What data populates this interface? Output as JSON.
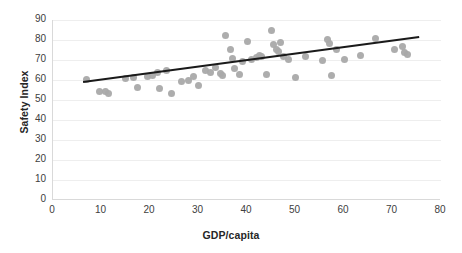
{
  "chart_data": {
    "type": "scatter",
    "title": "",
    "xlabel": "GDP/capita",
    "ylabel": "Safety Index",
    "xlim": [
      0,
      80
    ],
    "ylim": [
      0,
      90
    ],
    "xticks": [
      0,
      10,
      20,
      30,
      40,
      50,
      60,
      70,
      80
    ],
    "yticks": [
      0,
      10,
      20,
      30,
      40,
      50,
      60,
      70,
      80,
      90
    ],
    "grid": "horizontal",
    "legend": "none",
    "marker_color": "#a9a9a9",
    "trendline_color": "#1a1a1a",
    "points": [
      {
        "x": 7.0,
        "y": 60.5
      },
      {
        "x": 9.5,
        "y": 54.5
      },
      {
        "x": 10.8,
        "y": 54.5
      },
      {
        "x": 11.5,
        "y": 53.5
      },
      {
        "x": 15.0,
        "y": 61.0
      },
      {
        "x": 16.5,
        "y": 61.5
      },
      {
        "x": 17.5,
        "y": 56.5
      },
      {
        "x": 19.5,
        "y": 62.0
      },
      {
        "x": 20.5,
        "y": 62.5
      },
      {
        "x": 21.5,
        "y": 64.0
      },
      {
        "x": 22.0,
        "y": 56.0
      },
      {
        "x": 23.5,
        "y": 65.0
      },
      {
        "x": 24.5,
        "y": 53.5
      },
      {
        "x": 26.5,
        "y": 59.5
      },
      {
        "x": 28.0,
        "y": 60.0
      },
      {
        "x": 29.0,
        "y": 62.0
      },
      {
        "x": 30.0,
        "y": 57.5
      },
      {
        "x": 31.5,
        "y": 65.0
      },
      {
        "x": 32.5,
        "y": 64.0
      },
      {
        "x": 33.5,
        "y": 66.5
      },
      {
        "x": 34.5,
        "y": 63.5
      },
      {
        "x": 35.0,
        "y": 62.5
      },
      {
        "x": 35.5,
        "y": 82.5
      },
      {
        "x": 36.5,
        "y": 75.5
      },
      {
        "x": 37.0,
        "y": 71.0
      },
      {
        "x": 37.5,
        "y": 66.0
      },
      {
        "x": 38.5,
        "y": 63.0
      },
      {
        "x": 39.0,
        "y": 69.5
      },
      {
        "x": 40.0,
        "y": 79.5
      },
      {
        "x": 41.0,
        "y": 70.5
      },
      {
        "x": 42.0,
        "y": 71.5
      },
      {
        "x": 42.5,
        "y": 72.5
      },
      {
        "x": 43.0,
        "y": 72.0
      },
      {
        "x": 44.0,
        "y": 63.0
      },
      {
        "x": 45.0,
        "y": 85.0
      },
      {
        "x": 45.5,
        "y": 78.0
      },
      {
        "x": 46.0,
        "y": 75.5
      },
      {
        "x": 46.5,
        "y": 74.5
      },
      {
        "x": 47.0,
        "y": 79.0
      },
      {
        "x": 47.5,
        "y": 72.0
      },
      {
        "x": 48.5,
        "y": 70.5
      },
      {
        "x": 50.0,
        "y": 61.5
      },
      {
        "x": 52.0,
        "y": 72.0
      },
      {
        "x": 55.5,
        "y": 70.0
      },
      {
        "x": 56.5,
        "y": 80.5
      },
      {
        "x": 57.0,
        "y": 78.5
      },
      {
        "x": 57.5,
        "y": 62.5
      },
      {
        "x": 58.5,
        "y": 75.5
      },
      {
        "x": 60.0,
        "y": 70.5
      },
      {
        "x": 63.5,
        "y": 72.5
      },
      {
        "x": 66.5,
        "y": 81.0
      },
      {
        "x": 70.5,
        "y": 75.5
      },
      {
        "x": 72.0,
        "y": 77.0
      },
      {
        "x": 72.5,
        "y": 74.0
      },
      {
        "x": 73.0,
        "y": 73.0
      }
    ],
    "trendline": {
      "x0": 6.2,
      "y0": 59.0,
      "x1": 75.5,
      "y1": 81.5
    }
  }
}
